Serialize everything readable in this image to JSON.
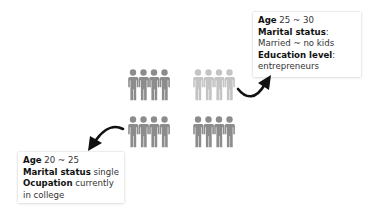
{
  "personas": [
    {
      "id": "young-professional",
      "lines": [
        {
          "label": "Age",
          "value": " 25 ~ 30"
        },
        {
          "label": "Marital status",
          "value": ":"
        },
        {
          "label": "",
          "value": "Married ~ no kids"
        },
        {
          "label": "Education level",
          "value": ":"
        },
        {
          "label": "",
          "value": "entrepreneurs"
        }
      ]
    },
    {
      "id": "student",
      "lines": [
        {
          "label": "Age",
          "value": " 20 ~ 25"
        },
        {
          "label": "Marital status",
          "value": " single"
        },
        {
          "label": "Ocupation",
          "value": " currently"
        },
        {
          "label": "",
          "value": "in college"
        }
      ]
    }
  ],
  "groups": [
    {
      "position": "top-left",
      "color": "#8c8c8c"
    },
    {
      "position": "top-right",
      "color": "#bdbdbd"
    },
    {
      "position": "bottom-left",
      "color": "#8c8c8c"
    },
    {
      "position": "bottom-right",
      "color": "#8c8c8c"
    }
  ],
  "colors": {
    "arrow": "#111111",
    "text": "#333333"
  }
}
